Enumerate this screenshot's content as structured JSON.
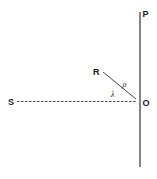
{
  "diagram": {
    "type": "geometric",
    "colors": {
      "line": "#333333",
      "background": "#ffffff"
    },
    "points": {
      "P": {
        "label": "P"
      },
      "O": {
        "label": "O"
      },
      "S": {
        "label": "S"
      },
      "R": {
        "label": "R"
      }
    },
    "segments": [
      {
        "from": "P",
        "to": "bottom",
        "style": "solid",
        "name": "vertical-line"
      },
      {
        "from": "S",
        "to": "O",
        "style": "dashed",
        "name": "SO-line"
      },
      {
        "from": "R",
        "to": "O",
        "style": "solid",
        "name": "RO-line"
      }
    ],
    "annotations": {
      "rho": "ρ",
      "lambda": "λ"
    }
  }
}
